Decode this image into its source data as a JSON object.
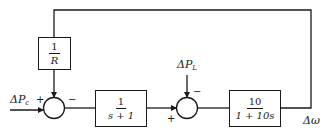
{
  "diagram": {
    "type": "block-diagram",
    "title": "",
    "blocks": [
      {
        "id": "droop",
        "numerator": "1",
        "denominator": "R"
      },
      {
        "id": "governor",
        "numerator": "1",
        "denominator": "s + 1"
      },
      {
        "id": "plant",
        "numerator": "10",
        "denominator": "1 + 10s"
      }
    ],
    "summing_junctions": [
      {
        "id": "sum1",
        "inputs": [
          {
            "from": "ΔPc",
            "sign": "+"
          },
          {
            "from": "1/R feedback",
            "sign": "−"
          }
        ]
      },
      {
        "id": "sum2",
        "inputs": [
          {
            "from": "governor",
            "sign": "+"
          },
          {
            "from": "ΔPL",
            "sign": "−"
          }
        ]
      }
    ],
    "signals": {
      "input_base": "ΔP",
      "input_sub": "c",
      "disturbance_base": "ΔP",
      "disturbance_sub": "L",
      "output": "Δω"
    },
    "signs": {
      "sum1_plus": "+",
      "sum1_minus": "−",
      "sum2_plus": "+",
      "sum2_minus": "−"
    },
    "connections": [
      "ΔPc → sum1(+)",
      "sum1 → 1/(s+1)",
      "1/(s+1) → sum2(+)",
      "ΔPL → sum2(−)",
      "sum2 → 10/(1+10s)",
      "10/(1+10s) → Δω",
      "Δω → 1/R → sum1(−)"
    ]
  }
}
